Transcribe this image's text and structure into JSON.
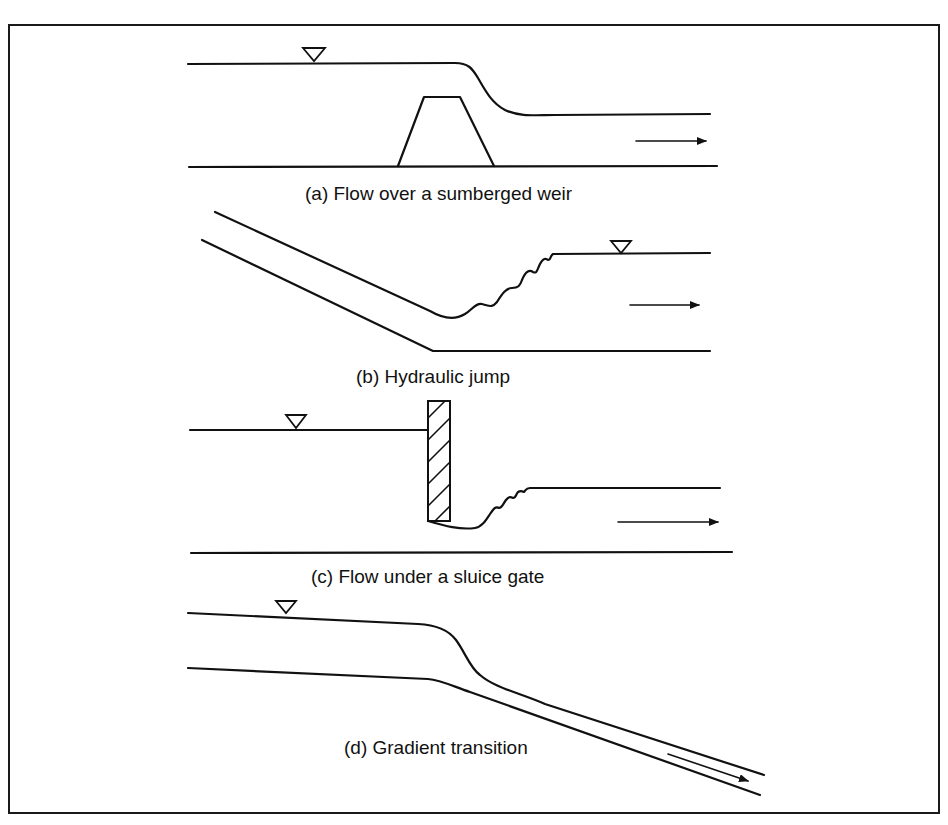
{
  "figure": {
    "panels": [
      {
        "id": "a",
        "caption": "(a) Flow over a sumberged weir"
      },
      {
        "id": "b",
        "caption": "(b) Hydraulic jump"
      },
      {
        "id": "c",
        "caption": "(c) Flow under a sluice gate"
      },
      {
        "id": "d",
        "caption": "(d) Gradient transition"
      }
    ],
    "symbols": {
      "water_surface_marker": "inverted-triangle",
      "flow_direction": "arrow-right"
    },
    "colors": {
      "line": "#111111",
      "background": "#ffffff"
    }
  }
}
